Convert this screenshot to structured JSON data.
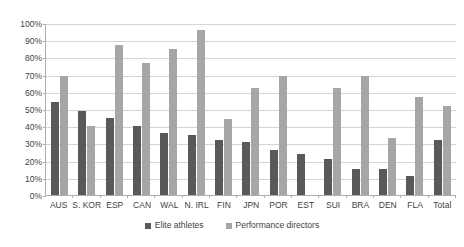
{
  "chart_data": {
    "type": "bar",
    "title": "",
    "subtitle": "",
    "xlabel": "",
    "ylabel": "",
    "ylim": [
      0,
      100
    ],
    "y_unit": "%",
    "grid": true,
    "legend_position": "bottom",
    "categories": [
      "AUS",
      "S. KOR",
      "ESP",
      "CAN",
      "WAL",
      "N. IRL",
      "FIN",
      "JPN",
      "POR",
      "EST",
      "SUI",
      "BRA",
      "DEN",
      "FLA",
      "Total"
    ],
    "ytick_labels": [
      "100%",
      "90%",
      "80%",
      "70%",
      "60%",
      "50%",
      "40%",
      "30%",
      "20%",
      "10%",
      "0%"
    ],
    "ytick_values": [
      100,
      90,
      80,
      70,
      60,
      50,
      40,
      30,
      20,
      10,
      0
    ],
    "series": [
      {
        "name": "Elite athletes",
        "color": "#595959",
        "values": [
          54,
          49,
          45,
          40,
          36,
          35,
          32,
          31,
          26,
          24,
          21,
          15,
          15,
          11,
          32
        ]
      },
      {
        "name": "Performance directors",
        "color": "#a6a6a6",
        "values": [
          69,
          40,
          87,
          77,
          85,
          96,
          44,
          62,
          69,
          null,
          62,
          69,
          33,
          57,
          52
        ]
      }
    ]
  }
}
